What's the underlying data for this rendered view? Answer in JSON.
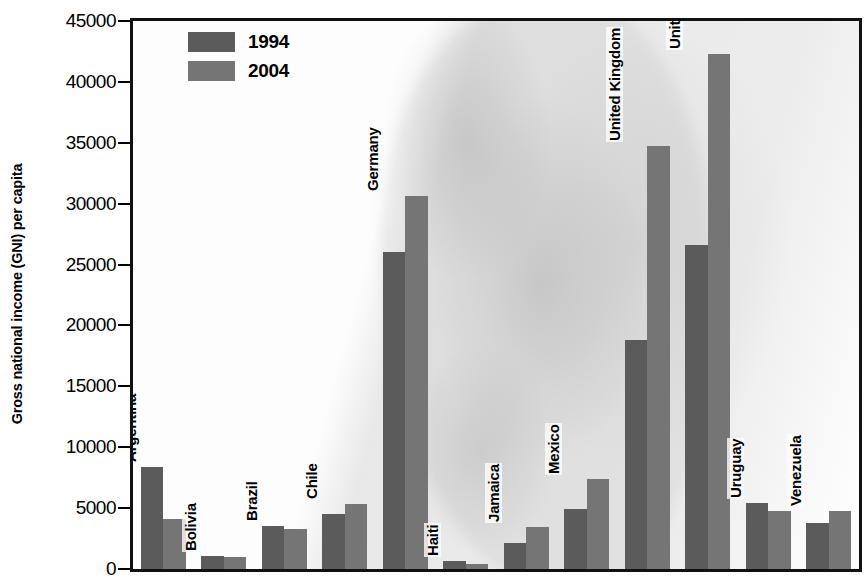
{
  "chart_data": {
    "type": "bar",
    "title": "",
    "xlabel": "",
    "ylabel": "Gross national income (GNI) per capita",
    "ylim": [
      0,
      45000
    ],
    "ytick_labels": [
      "45000",
      "40000",
      "35000",
      "30000",
      "25000",
      "20000",
      "15000",
      "10000",
      "5000",
      "0"
    ],
    "yticks": [
      45000,
      40000,
      35000,
      30000,
      25000,
      20000,
      15000,
      10000,
      5000,
      0
    ],
    "grid": false,
    "legend_position": "top-left-inside",
    "categories": [
      "Argentina",
      "Bolivia",
      "Brazil",
      "Chile",
      "Germany",
      "Haiti",
      "Jamaica",
      "Mexico",
      "United Kingdom",
      "United States",
      "Uruguay",
      "Venezuela"
    ],
    "series": [
      {
        "name": "1994",
        "color": "#5b5b5b",
        "values": [
          8400,
          1050,
          3500,
          4500,
          26000,
          650,
          2100,
          4900,
          18800,
          26600,
          5400,
          3800
        ]
      },
      {
        "name": "2004",
        "color": "#757575",
        "values": [
          4100,
          1000,
          3300,
          5300,
          30600,
          450,
          3450,
          7400,
          34700,
          42300,
          4750,
          4800
        ]
      }
    ]
  },
  "legend": {
    "items": [
      {
        "label": "1994",
        "color": "#5b5b5b"
      },
      {
        "label": "2004",
        "color": "#757575"
      }
    ]
  },
  "colors": {
    "series_1994": "#5b5b5b",
    "series_2004": "#757575",
    "axis": "#111111",
    "background": "#ffffff"
  }
}
